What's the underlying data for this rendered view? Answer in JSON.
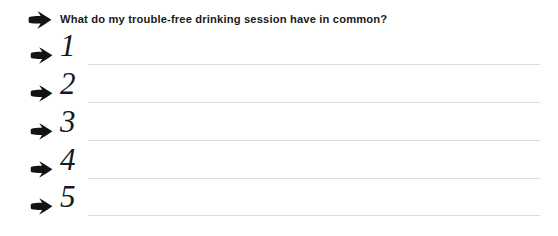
{
  "page": {
    "background_color": "#ffffff",
    "rule_color": "#dddee0",
    "ink_color": "#16191c"
  },
  "prompt": {
    "bullet_icon": "bold-right-arrow-icon",
    "question": "What do my trouble-free drinking session have in common?"
  },
  "answer_lines": [
    {
      "bullet_icon": "bold-right-arrow-icon",
      "number": "1",
      "value": ""
    },
    {
      "bullet_icon": "bold-right-arrow-icon",
      "number": "2",
      "value": ""
    },
    {
      "bullet_icon": "bold-right-arrow-icon",
      "number": "3",
      "value": ""
    },
    {
      "bullet_icon": "bold-right-arrow-icon",
      "number": "4",
      "value": ""
    },
    {
      "bullet_icon": "bold-right-arrow-icon",
      "number": "5",
      "value": ""
    }
  ]
}
